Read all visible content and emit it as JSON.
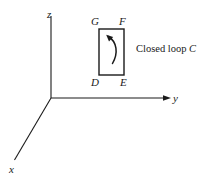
{
  "figure": {
    "background_color": "#ffffff",
    "stroke_color": "#1a1a1a",
    "axes": {
      "z": {
        "label": "z",
        "origin": [
          51,
          98
        ],
        "end": [
          51,
          16
        ],
        "arrow": false
      },
      "y": {
        "label": "y",
        "origin": [
          51,
          98
        ],
        "end": [
          170,
          98
        ],
        "arrow": true
      },
      "x": {
        "label": "x",
        "origin": [
          51,
          98
        ],
        "end": [
          14,
          161
        ],
        "arrow": false
      }
    },
    "loop": {
      "caption": "Closed loop ",
      "caption_symbol": "C",
      "vertices": [
        {
          "label": "G",
          "corner": "top-left"
        },
        {
          "label": "F",
          "corner": "top-right"
        },
        {
          "label": "E",
          "corner": "bottom-right"
        },
        {
          "label": "D",
          "corner": "bottom-left"
        }
      ],
      "rect": {
        "x": 99,
        "y": 29,
        "width": 25,
        "height": 46
      },
      "orientation_arrow": "counterclockwise-curved-arrow"
    }
  }
}
